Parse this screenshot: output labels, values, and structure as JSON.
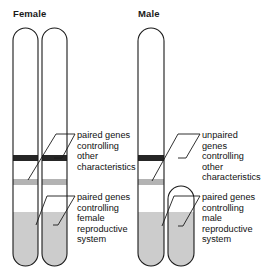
{
  "headings": {
    "female": "Female",
    "male": "Male"
  },
  "labels": {
    "female_other": "paired genes\ncontrolling\nother\ncharacteristics",
    "female_reproductive": "paired genes\ncontrolling\nfemale\nreproductive\nsystem",
    "male_other": "unpaired\ngenes\ncontrolling\nother\ncharacteristics",
    "male_reproductive": "paired genes\ncontrolling\nmale\nreproductive\nsystem"
  },
  "colors": {
    "outline": "#1a1a1a",
    "dark_band": "#262626",
    "gray_band": "#b3b3b3",
    "shaded_region": "#cccccc",
    "background": "#ffffff",
    "text": "#111111"
  },
  "diagram": {
    "type": "sex-chromosome-comparison",
    "female_chromosomes": [
      {
        "name": "x-chromosome-left",
        "x": 13,
        "top": 28,
        "width": 25,
        "bottom": 266
      },
      {
        "name": "x-chromosome-right",
        "x": 42,
        "top": 28,
        "width": 25,
        "bottom": 266
      }
    ],
    "male_chromosomes": [
      {
        "name": "x-chromosome",
        "x": 138,
        "top": 28,
        "width": 26,
        "bottom": 266
      },
      {
        "name": "y-chromosome",
        "x": 168,
        "top": 186,
        "width": 26,
        "bottom": 266
      }
    ],
    "bands": {
      "dark_band_y": 155,
      "dark_band_height": 6,
      "gray_band_y": 179,
      "gray_band_height": 6,
      "shaded_start_y": 212,
      "y_shaded_start_y": 212
    }
  }
}
